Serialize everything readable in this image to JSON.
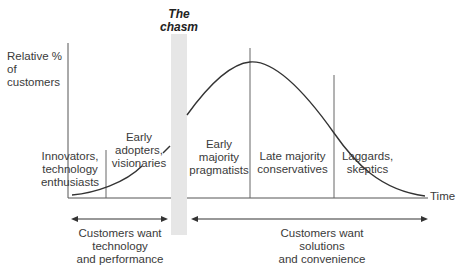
{
  "diagram": {
    "y_axis_label": "Relative % of customers",
    "x_axis_label": "Time",
    "chasm_label": [
      "The",
      "chasm"
    ],
    "segments": [
      {
        "id": "innovators",
        "lines": [
          "Innovators,",
          "technology",
          "enthusiasts"
        ]
      },
      {
        "id": "early-adopters",
        "lines": [
          "Early",
          "adopters,",
          "visionaries"
        ]
      },
      {
        "id": "early-majority",
        "lines": [
          "Early",
          "majority",
          "pragmatists"
        ]
      },
      {
        "id": "late-majority",
        "lines": [
          "Late majority",
          "conservatives"
        ]
      },
      {
        "id": "laggards",
        "lines": [
          "Laggards,",
          "skeptics"
        ]
      }
    ],
    "bottom_arrows": [
      {
        "id": "technology",
        "lines": [
          "Customers want",
          "technology",
          "and performance"
        ]
      },
      {
        "id": "solutions",
        "lines": [
          "Customers want",
          "solutions",
          "and convenience"
        ]
      }
    ],
    "colors": {
      "line": "#333333",
      "chasm": "#e6e6e6",
      "divider": "#666666"
    }
  }
}
